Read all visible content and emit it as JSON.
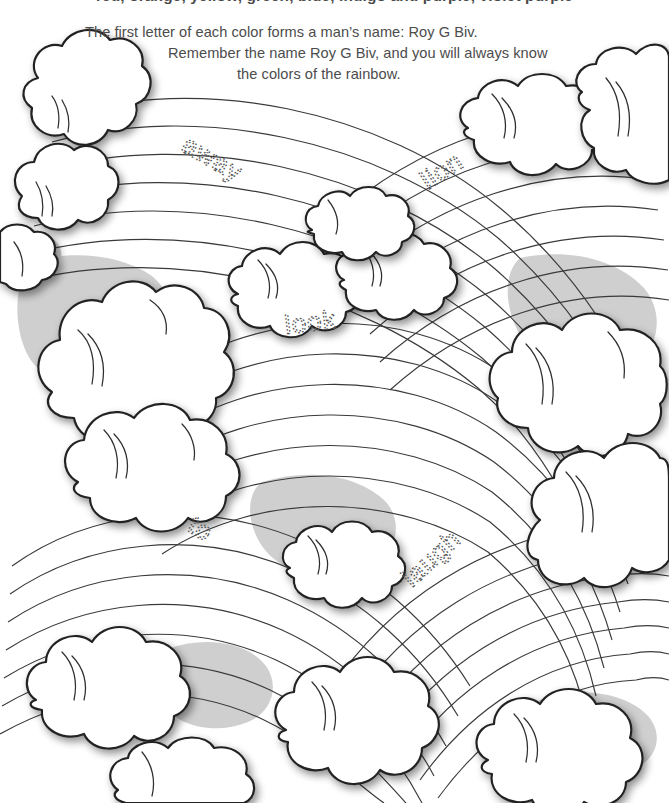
{
  "page": {
    "width": 669,
    "height": 803,
    "background_color": "#ffffff",
    "ink_color": "#2b2b2b",
    "shade_color": "#cfcfcf",
    "trace_color": "#575757"
  },
  "header": {
    "clipped_line": "red, orange, yellow, green, blue, indigo and purple, violet purple"
  },
  "instructions": {
    "line1": "The first letter of each color forms a man’s name: Roy G Biv.",
    "line2": "Remember the name Roy G Biv, and you will always know",
    "line3": "the colors of the rainbow."
  },
  "trace_words": [
    {
      "id": "away",
      "text": "away",
      "x": 180,
      "y": 150,
      "rotate": 30,
      "font_size": 27
    },
    {
      "id": "lion",
      "text": "lion",
      "x": 428,
      "y": 190,
      "rotate": -33,
      "font_size": 27
    },
    {
      "id": "look",
      "text": "look",
      "x": 286,
      "y": 334,
      "rotate": -7,
      "font_size": 27
    },
    {
      "id": "to",
      "text": "to",
      "x": 186,
      "y": 530,
      "rotate": 31,
      "font_size": 27
    },
    {
      "id": "laugh",
      "text": "laugh",
      "x": 412,
      "y": 588,
      "rotate": -43,
      "font_size": 27
    }
  ],
  "artwork": {
    "title": "rainbow-and-clouds-coloring-scene",
    "description": "Four rainbow arcs radiating from the lower area of the page, framed by puffy outlined cumulus clouds, with light gray shaded sky wedges between arcs.",
    "rainbow_count": 4,
    "stripes_per_rainbow": 7,
    "cloud_count": 14
  }
}
